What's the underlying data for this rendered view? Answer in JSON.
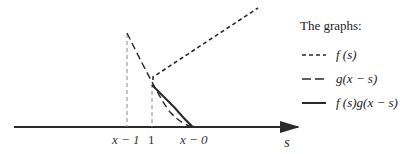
{
  "diagram": {
    "type": "convolution-illustration",
    "axis": {
      "variable": "s",
      "ticks": [
        {
          "label": "x − 1",
          "x": 127
        },
        {
          "label": "1",
          "x": 152
        },
        {
          "label": "x − 0",
          "x": 193
        }
      ]
    },
    "legend": {
      "title": "The graphs:",
      "items": [
        {
          "style": "short-dash",
          "label": "f (s)"
        },
        {
          "style": "long-dash",
          "label": "g(x − s)"
        },
        {
          "style": "solid",
          "label": "f (s)g(x − s)"
        }
      ]
    },
    "colors": {
      "line": "#2a2a2a",
      "guide": "#888888",
      "background": "#ffffff"
    }
  }
}
